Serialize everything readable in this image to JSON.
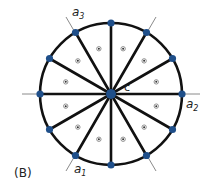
{
  "figure": {
    "panel_label": "(B)",
    "center_label": "c",
    "axis_labels": {
      "a1": {
        "base": "a",
        "sub": "1"
      },
      "a2": {
        "base": "a",
        "sub": "2"
      },
      "a3": {
        "base": "a",
        "sub": "3"
      }
    },
    "center": {
      "x": 111,
      "y": 94
    },
    "radius": 71,
    "spoke_count": 12,
    "colors": {
      "circle": "#111111",
      "spoke": "#111111",
      "vertex": "#1f4f8a",
      "axis_line": "#8a8a8a",
      "sector_marker": "#555555"
    }
  }
}
